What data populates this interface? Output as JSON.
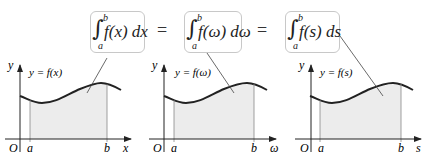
{
  "formulas": [
    {
      "integral": "∫",
      "upper": "b",
      "lower": "a",
      "integrand": "f(x) dx"
    },
    {
      "integral": "∫",
      "upper": "b",
      "lower": "a",
      "integrand": "f(ω) dω"
    },
    {
      "integral": "∫",
      "upper": "b",
      "lower": "a",
      "integrand": "f(s) ds"
    }
  ],
  "equals": [
    "=",
    "="
  ],
  "graphs": [
    {
      "y_label": "y",
      "curve_label": "y = f(x)",
      "origin": "O",
      "a": "a",
      "b": "b",
      "x_label": "x"
    },
    {
      "y_label": "y",
      "curve_label": "y = f(ω)",
      "origin": "O",
      "a": "a",
      "b": "b",
      "x_label": "ω"
    },
    {
      "y_label": "y",
      "curve_label": "y = f(s)",
      "origin": "O",
      "a": "a",
      "b": "b",
      "x_label": "s"
    }
  ],
  "colors": {
    "shade": "#ececec",
    "curve": "#222222",
    "axis": "#222222",
    "box_border": "#c8c8c8"
  }
}
